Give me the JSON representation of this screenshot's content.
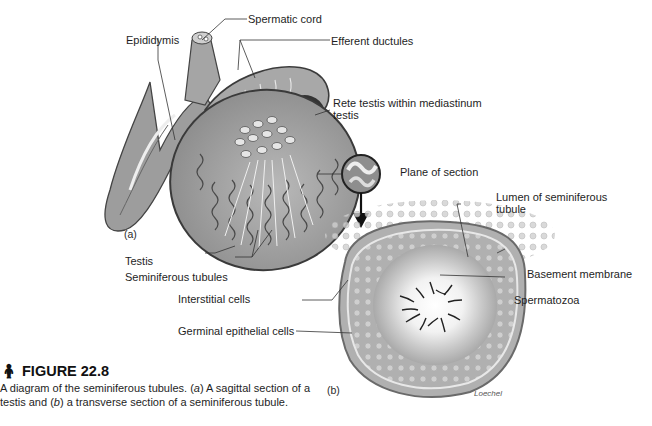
{
  "figure": {
    "icon": "anatomy-figure-icon",
    "title": "FIGURE 22.8",
    "caption_parts": [
      "A diagram of the seminiferous tubules. (",
      "a",
      ") A sagittal section of a testis and (",
      "b",
      ") a transverse section of a seminiferous tubule."
    ]
  },
  "panel_a": {
    "tag": "(a)",
    "labels": {
      "spermatic_cord": "Spermatic cord",
      "epididymis": "Epididymis",
      "efferent_ductules": "Efferent ductules",
      "rete_testis": "Rete testis within mediastinum testis",
      "testis": "Testis",
      "seminiferous_tubules": "Seminiferous tubules",
      "plane_of_section": "Plane of section"
    }
  },
  "panel_b": {
    "tag": "(b)",
    "signature": "Loechel",
    "labels": {
      "lumen": "Lumen of seminiferous tubule",
      "basement_membrane": "Basement membrane",
      "spermatozoa": "Spermatozoa",
      "interstitial_cells": "Interstitial cells",
      "germinal_epithelial_cells": "Germinal epithelial cells"
    }
  },
  "colors": {
    "tissue_dark": "#5d5d5d",
    "tissue_mid": "#9a9a9a",
    "tissue_light": "#d4d4d4",
    "leader_line": "#333333"
  }
}
